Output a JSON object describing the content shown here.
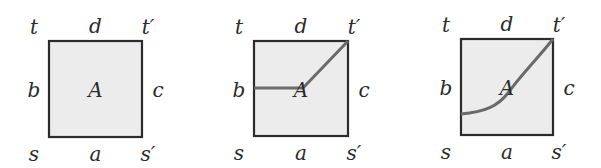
{
  "diagrams": [
    {
      "id": "plain",
      "square": {
        "x": 49,
        "y": 41,
        "w": 93,
        "h": 96
      },
      "labels": {
        "t": "t",
        "d": "d",
        "t_prime": "t′",
        "b": "b",
        "center": "A",
        "c": "c",
        "s": "s",
        "a": "a",
        "s_prime": "s′"
      },
      "path": ""
    },
    {
      "id": "piecewise-path",
      "square": {
        "x": 254,
        "y": 41,
        "w": 94,
        "h": 95
      },
      "labels": {
        "t": "t",
        "d": "d",
        "t_prime": "t′",
        "b": "b",
        "center": "A",
        "c": "c",
        "s": "s",
        "a": "a",
        "s_prime": "s′"
      },
      "path": "M254,88 L303,88 L348,41"
    },
    {
      "id": "smooth-path",
      "square": {
        "x": 461,
        "y": 39,
        "w": 92,
        "h": 96
      },
      "labels": {
        "t": "t",
        "d": "d",
        "t_prime": "t′",
        "b": "b",
        "center": "A",
        "c": "c",
        "s": "s",
        "a": "a",
        "s_prime": "s′"
      },
      "path": "M461,114 C485,112 498,106 508,93 C522,74 538,58 553,39"
    }
  ],
  "colors": {
    "fill": "#ececec",
    "stroke": "#2b2b2b",
    "path": "#6a6a6a"
  }
}
